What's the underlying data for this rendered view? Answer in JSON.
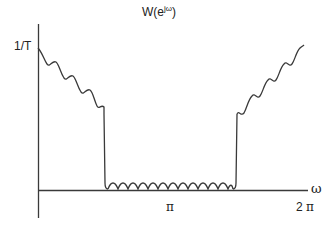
{
  "title": {
    "base": "W(e",
    "superscript": "jω",
    "close": ")"
  },
  "y_axis": {
    "tick_label": "1/T"
  },
  "x_axis": {
    "label": "ω",
    "ticks": [
      {
        "label": "π"
      },
      {
        "label": "2",
        "symbol": "π"
      }
    ]
  },
  "colors": {
    "line": "#3a3a3a",
    "background": "#ffffff"
  }
}
